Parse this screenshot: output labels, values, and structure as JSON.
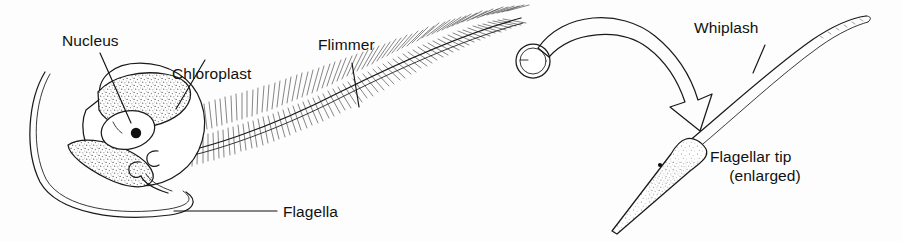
{
  "figure": {
    "background_color": "#fdfdfd",
    "ink_color": "#1a1a1a",
    "stipple_color": "#555555"
  },
  "labels": {
    "nucleus": "Nucleus",
    "chloroplast": "Chloroplast",
    "flimmer": "Flimmer",
    "flagella": "Flagella",
    "whiplash": "Whiplash",
    "flagellar_tip_line1": "Flagellar tip",
    "flagellar_tip_line2": "(enlarged)"
  },
  "structures": {
    "cell_body": "cell-body",
    "nucleus_organelle": "nucleus-organelle",
    "nucleolus": "nucleolus",
    "chloroplast_upper": "chloroplast-upper",
    "chloroplast_lower": "chloroplast-lower",
    "flimmer_flagellum": "flimmer-flagellum",
    "smooth_flagellum": "smooth-flagellum",
    "magnifier_circle": "magnifier-circle",
    "magnify_arrow": "magnify-arrow",
    "whiplash_flagellum": "whiplash-flagellum",
    "flagellar_tip": "flagellar-tip",
    "tip_dot": "tip-dot"
  }
}
